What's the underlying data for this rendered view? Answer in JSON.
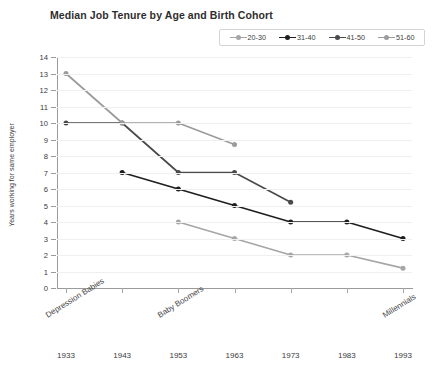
{
  "chart_data": {
    "type": "line",
    "title": "Median Job Tenure by Age and Birth Cohort",
    "xlabel": "Birth year",
    "ylabel": "Years working for same employer",
    "x": [
      1933,
      1943,
      1953,
      1963,
      1973,
      1983,
      1993
    ],
    "xtick_labels": [
      "1933",
      "1943",
      "1953",
      "1963",
      "1973",
      "1983",
      "1993"
    ],
    "ytick_labels": [
      "0",
      "1",
      "2",
      "3",
      "4",
      "5",
      "6",
      "7",
      "8",
      "9",
      "10",
      "11",
      "12",
      "13",
      "14"
    ],
    "ylim": [
      0,
      14
    ],
    "ystep": 1,
    "grid": true,
    "legend_position": "top-right",
    "series": [
      {
        "name": "20-30",
        "color": "#a6a6a6",
        "points": [
          {
            "x": 1953,
            "y": 4
          },
          {
            "x": 1963,
            "y": 3
          },
          {
            "x": 1973,
            "y": 2
          },
          {
            "x": 1983,
            "y": 2
          },
          {
            "x": 1993,
            "y": 1.2
          }
        ]
      },
      {
        "name": "31-40",
        "color": "#1f1f1f",
        "points": [
          {
            "x": 1943,
            "y": 7
          },
          {
            "x": 1953,
            "y": 6
          },
          {
            "x": 1963,
            "y": 5
          },
          {
            "x": 1973,
            "y": 4
          },
          {
            "x": 1983,
            "y": 4
          },
          {
            "x": 1993,
            "y": 3
          }
        ]
      },
      {
        "name": "41-50",
        "color": "#4a4a4a",
        "points": [
          {
            "x": 1933,
            "y": 10
          },
          {
            "x": 1943,
            "y": 10
          },
          {
            "x": 1953,
            "y": 7
          },
          {
            "x": 1963,
            "y": 7
          },
          {
            "x": 1973,
            "y": 5.2
          }
        ]
      },
      {
        "name": "51-60",
        "color": "#9b9b9b",
        "points": [
          {
            "x": 1933,
            "y": 13
          },
          {
            "x": 1943,
            "y": 10
          },
          {
            "x": 1953,
            "y": 10
          },
          {
            "x": 1963,
            "y": 8.7
          }
        ]
      }
    ],
    "annotations": [
      {
        "text": "Depression Babies",
        "x": 1933
      },
      {
        "text": "Baby Boomers",
        "x": 1953
      },
      {
        "text": "Millennials",
        "x": 1993
      }
    ]
  }
}
